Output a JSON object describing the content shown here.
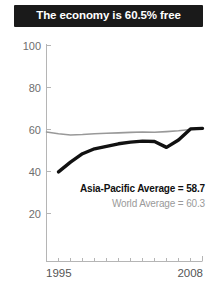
{
  "title": {
    "text": "The economy is 60.5% free"
  },
  "legend": {
    "primary": "Asia-Pacific Average = 58.7",
    "secondary": "World Average = 60.3"
  },
  "colors": {
    "title_bar_bg": "#1a1a1a",
    "title_text": "#ffffff",
    "primary_series": "#111111",
    "secondary_series": "#999999",
    "axis": "#b0b0b0",
    "tick_label": "#6e6e6e"
  },
  "chart_data": {
    "type": "line",
    "title": "The economy is 60.5% free",
    "subtitle": "",
    "xlabel": "",
    "ylabel": "",
    "xlim": [
      1995,
      2008
    ],
    "ylim": [
      0,
      100
    ],
    "yticks": [
      20,
      40,
      60,
      80,
      100
    ],
    "ytick_labels": [
      "20",
      "40",
      "60",
      "80",
      "100"
    ],
    "xticks": [
      1995,
      1996,
      1997,
      1998,
      1999,
      2000,
      2001,
      2002,
      2003,
      2004,
      2005,
      2006,
      2007,
      2008
    ],
    "xtick_labels_shown": [
      "1995",
      "2008"
    ],
    "grid": false,
    "legend_position": "inside-center",
    "x": [
      1995,
      1996,
      1997,
      1998,
      1999,
      2000,
      2001,
      2002,
      2003,
      2004,
      2005,
      2006,
      2007,
      2008
    ],
    "series": [
      {
        "name": "Asia-Pacific Average = 58.7",
        "label": "Country",
        "color": "#111111",
        "style": "thick",
        "values": [
          null,
          39.8,
          44.5,
          48.5,
          50.8,
          52.0,
          53.2,
          54.0,
          54.5,
          54.3,
          51.5,
          55.0,
          60.3,
          60.5
        ]
      },
      {
        "name": "World Average = 60.3",
        "label": "World Average",
        "color": "#999999",
        "style": "thin",
        "values": [
          58.8,
          58.0,
          57.4,
          57.6,
          58.0,
          58.2,
          58.4,
          58.6,
          58.8,
          58.7,
          59.0,
          59.4,
          60.0,
          60.3
        ]
      }
    ],
    "annotations": [
      {
        "text": "Asia-Pacific Average = 58.7",
        "kind": "legend-inline"
      },
      {
        "text": "World Average = 60.3",
        "kind": "legend-inline"
      }
    ]
  }
}
